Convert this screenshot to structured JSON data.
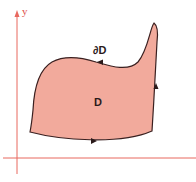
{
  "diagram": {
    "axes": {
      "y_label": "y",
      "axis_color": "#e8685f"
    },
    "region": {
      "label": "D",
      "fill_color": "#f2aa9c",
      "stroke_color": "#3a2020"
    },
    "boundary": {
      "label": "∂D",
      "orientation": "counterclockwise"
    }
  }
}
